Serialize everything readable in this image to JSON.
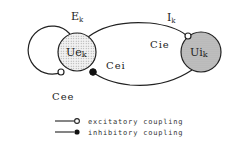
{
  "diagram": {
    "nodes": [
      {
        "id": "Ue",
        "label": "Ue",
        "sub": "k",
        "fill": "#e4e4e4"
      },
      {
        "id": "Ui",
        "label": "Ui",
        "sub": "k",
        "fill": "#bcbcbc"
      }
    ],
    "group_labels": {
      "E": {
        "main": "E",
        "sub": "k"
      },
      "I": {
        "main": "I",
        "sub": "k"
      }
    },
    "couplings": {
      "Cee": "Cee",
      "Cie": "Cie",
      "Cei": "Cei"
    }
  },
  "legend": {
    "excitatory": "excitatory coupling",
    "inhibitory": "inhibitory coupling"
  },
  "colors": {
    "stroke": "#222222",
    "ue_fill": "#e4e4e4",
    "ui_fill": "#bcbcbc"
  }
}
